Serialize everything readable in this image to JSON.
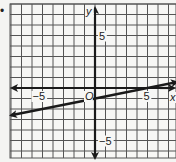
{
  "bullet": "•",
  "chart_data": {
    "type": "line",
    "title": "",
    "xlabel": "x",
    "ylabel": "y",
    "origin_label": "O",
    "xlim": [
      -8,
      8
    ],
    "ylim": [
      -6.6,
      8
    ],
    "grid": true,
    "grid_step": 1,
    "x_tick_labels": [
      {
        "value": -5,
        "label": "−5"
      },
      {
        "value": 5,
        "label": "5"
      }
    ],
    "y_tick_labels": [
      {
        "value": 5,
        "label": "5"
      },
      {
        "value": -5,
        "label": "−5"
      }
    ],
    "series": [
      {
        "name": "line",
        "equation": "y = (1/5)x - 1",
        "slope": 0.2,
        "intercept": -1,
        "x": [
          -8,
          7.8
        ],
        "y": [
          -2.6,
          0.56
        ],
        "arrows": "both"
      }
    ],
    "colors": {
      "grid": "#555555",
      "axes": "#1a1a1a",
      "line": "#1a1a1a",
      "background": "#f4f4f2"
    }
  }
}
